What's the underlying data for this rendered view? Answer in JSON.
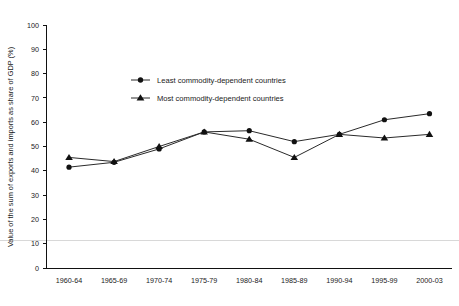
{
  "chart_data": {
    "type": "line",
    "title": "",
    "xlabel": "",
    "ylabel": "Value of the sum of exports and imports as share of GDP (%)",
    "ylim": [
      0,
      100
    ],
    "ytick_step": 10,
    "yticks": [
      "0",
      "10",
      "20",
      "30",
      "40",
      "50",
      "60",
      "70",
      "80",
      "90",
      "100"
    ],
    "grid": false,
    "legend_position": "upper-center-left",
    "categories": [
      "1960-64",
      "1965-69",
      "1970-74",
      "1975-79",
      "1980-84",
      "1985-89",
      "1990-94",
      "1995-99",
      "2000-03"
    ],
    "series": [
      {
        "name": "Least commodity-dependent countries",
        "marker": "circle",
        "color": "#111111",
        "values": [
          41.5,
          43.5,
          49.0,
          56.0,
          56.5,
          52.0,
          55.0,
          61.0,
          63.5
        ]
      },
      {
        "name": "Most commodity-dependent countries",
        "marker": "triangle",
        "color": "#111111",
        "values": [
          45.5,
          43.8,
          50.0,
          56.0,
          53.0,
          45.5,
          55.0,
          53.5,
          55.0
        ]
      }
    ]
  },
  "legend": {
    "items": [
      {
        "label": "Least commodity-dependent countries",
        "marker": "circle"
      },
      {
        "label": "Most commodity-dependent countries",
        "marker": "triangle"
      }
    ]
  },
  "axes": {
    "y_title": "Value of the sum of exports and imports as share of GDP (%)"
  }
}
